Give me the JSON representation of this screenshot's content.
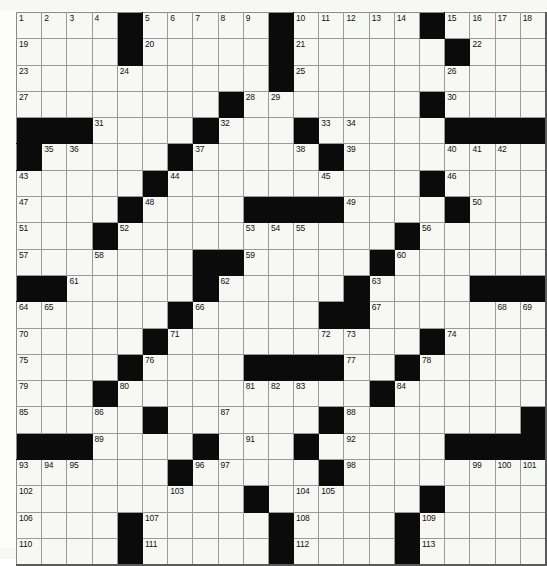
{
  "puzzle": {
    "kind": "crossword-grid",
    "rows": 21,
    "cols": 21,
    "colors": {
      "block": "#0b0b0b",
      "cell": "#f7f7f4",
      "gridline": "#9a9a9a",
      "number": "#111111",
      "page": "#ffffff"
    },
    "blocks": [
      [
        4,
        10,
        16
      ],
      [
        4,
        10,
        17
      ],
      [
        10
      ],
      [
        8,
        16
      ],
      [
        0,
        1,
        2,
        7,
        11,
        17,
        18,
        19,
        20
      ],
      [
        0,
        6,
        12
      ],
      [
        5,
        16
      ],
      [
        4,
        9,
        10,
        11,
        12,
        17
      ],
      [
        3,
        15
      ],
      [
        7,
        8,
        14
      ],
      [
        0,
        1,
        7,
        13,
        18,
        19,
        20
      ],
      [
        6,
        12,
        13
      ],
      [
        5,
        16
      ],
      [
        4,
        9,
        10,
        11,
        12,
        15
      ],
      [
        3,
        14
      ],
      [
        5,
        12,
        20
      ],
      [
        0,
        1,
        2,
        7,
        11,
        17,
        18,
        19,
        20
      ],
      [
        6,
        12
      ],
      [
        9,
        16
      ],
      [
        4,
        10,
        15
      ],
      [
        4,
        10,
        15
      ]
    ],
    "numbers": [
      {
        "r": 0,
        "c": 0,
        "n": "1"
      },
      {
        "r": 0,
        "c": 1,
        "n": "2"
      },
      {
        "r": 0,
        "c": 2,
        "n": "3"
      },
      {
        "r": 0,
        "c": 3,
        "n": "4"
      },
      {
        "r": 0,
        "c": 5,
        "n": "5"
      },
      {
        "r": 0,
        "c": 6,
        "n": "6"
      },
      {
        "r": 0,
        "c": 7,
        "n": "7"
      },
      {
        "r": 0,
        "c": 8,
        "n": "8"
      },
      {
        "r": 0,
        "c": 9,
        "n": "9"
      },
      {
        "r": 0,
        "c": 11,
        "n": "10"
      },
      {
        "r": 0,
        "c": 12,
        "n": "11"
      },
      {
        "r": 0,
        "c": 13,
        "n": "12"
      },
      {
        "r": 0,
        "c": 14,
        "n": "13"
      },
      {
        "r": 0,
        "c": 15,
        "n": "14"
      },
      {
        "r": 0,
        "c": 17,
        "n": "15"
      },
      {
        "r": 0,
        "c": 18,
        "n": "16"
      },
      {
        "r": 0,
        "c": 19,
        "n": "17"
      },
      {
        "r": 0,
        "c": 20,
        "n": "18"
      },
      {
        "r": 1,
        "c": 0,
        "n": "19"
      },
      {
        "r": 1,
        "c": 5,
        "n": "20"
      },
      {
        "r": 1,
        "c": 11,
        "n": "21"
      },
      {
        "r": 1,
        "c": 18,
        "n": "22"
      },
      {
        "r": 2,
        "c": 0,
        "n": "23"
      },
      {
        "r": 2,
        "c": 4,
        "n": "24"
      },
      {
        "r": 2,
        "c": 11,
        "n": "25"
      },
      {
        "r": 2,
        "c": 17,
        "n": "26"
      },
      {
        "r": 3,
        "c": 0,
        "n": "27"
      },
      {
        "r": 3,
        "c": 9,
        "n": "28"
      },
      {
        "r": 3,
        "c": 10,
        "n": "29"
      },
      {
        "r": 3,
        "c": 17,
        "n": "30"
      },
      {
        "r": 4,
        "c": 3,
        "n": "31"
      },
      {
        "r": 4,
        "c": 8,
        "n": "32"
      },
      {
        "r": 4,
        "c": 12,
        "n": "33"
      },
      {
        "r": 4,
        "c": 13,
        "n": "34"
      },
      {
        "r": 5,
        "c": 1,
        "n": "35"
      },
      {
        "r": 5,
        "c": 2,
        "n": "36"
      },
      {
        "r": 5,
        "c": 7,
        "n": "37"
      },
      {
        "r": 5,
        "c": 11,
        "n": "38"
      },
      {
        "r": 5,
        "c": 13,
        "n": "39"
      },
      {
        "r": 5,
        "c": 17,
        "n": "40"
      },
      {
        "r": 5,
        "c": 18,
        "n": "41"
      },
      {
        "r": 5,
        "c": 19,
        "n": "42"
      },
      {
        "r": 6,
        "c": 0,
        "n": "43"
      },
      {
        "r": 6,
        "c": 6,
        "n": "44"
      },
      {
        "r": 6,
        "c": 12,
        "n": "45"
      },
      {
        "r": 6,
        "c": 17,
        "n": "46"
      },
      {
        "r": 7,
        "c": 0,
        "n": "47"
      },
      {
        "r": 7,
        "c": 5,
        "n": "48"
      },
      {
        "r": 7,
        "c": 13,
        "n": "49"
      },
      {
        "r": 7,
        "c": 18,
        "n": "50"
      },
      {
        "r": 8,
        "c": 0,
        "n": "51"
      },
      {
        "r": 8,
        "c": 4,
        "n": "52"
      },
      {
        "r": 8,
        "c": 9,
        "n": "53"
      },
      {
        "r": 8,
        "c": 10,
        "n": "54"
      },
      {
        "r": 8,
        "c": 11,
        "n": "55"
      },
      {
        "r": 8,
        "c": 16,
        "n": "56"
      },
      {
        "r": 9,
        "c": 0,
        "n": "57"
      },
      {
        "r": 9,
        "c": 3,
        "n": "58"
      },
      {
        "r": 9,
        "c": 9,
        "n": "59"
      },
      {
        "r": 9,
        "c": 15,
        "n": "60"
      },
      {
        "r": 10,
        "c": 2,
        "n": "61"
      },
      {
        "r": 10,
        "c": 8,
        "n": "62"
      },
      {
        "r": 10,
        "c": 14,
        "n": "63"
      },
      {
        "r": 11,
        "c": 0,
        "n": "64"
      },
      {
        "r": 11,
        "c": 1,
        "n": "65"
      },
      {
        "r": 11,
        "c": 7,
        "n": "66"
      },
      {
        "r": 11,
        "c": 14,
        "n": "67"
      },
      {
        "r": 11,
        "c": 19,
        "n": "68"
      },
      {
        "r": 11,
        "c": 20,
        "n": "69"
      },
      {
        "r": 12,
        "c": 0,
        "n": "70"
      },
      {
        "r": 12,
        "c": 6,
        "n": "71"
      },
      {
        "r": 12,
        "c": 12,
        "n": "72"
      },
      {
        "r": 12,
        "c": 13,
        "n": "73"
      },
      {
        "r": 12,
        "c": 17,
        "n": "74"
      },
      {
        "r": 13,
        "c": 0,
        "n": "75"
      },
      {
        "r": 13,
        "c": 5,
        "n": "76"
      },
      {
        "r": 13,
        "c": 13,
        "n": "77"
      },
      {
        "r": 13,
        "c": 16,
        "n": "78"
      },
      {
        "r": 14,
        "c": 0,
        "n": "79"
      },
      {
        "r": 14,
        "c": 4,
        "n": "80"
      },
      {
        "r": 14,
        "c": 9,
        "n": "81"
      },
      {
        "r": 14,
        "c": 10,
        "n": "82"
      },
      {
        "r": 14,
        "c": 11,
        "n": "83"
      },
      {
        "r": 14,
        "c": 15,
        "n": "84"
      },
      {
        "r": 15,
        "c": 0,
        "n": "85"
      },
      {
        "r": 15,
        "c": 3,
        "n": "86"
      },
      {
        "r": 15,
        "c": 8,
        "n": "87"
      },
      {
        "r": 15,
        "c": 13,
        "n": "88"
      },
      {
        "r": 16,
        "c": 3,
        "n": "89"
      },
      {
        "r": 16,
        "c": 7,
        "n": "90"
      },
      {
        "r": 16,
        "c": 9,
        "n": "91"
      },
      {
        "r": 16,
        "c": 13,
        "n": "92"
      },
      {
        "r": 17,
        "c": 0,
        "n": "93"
      },
      {
        "r": 17,
        "c": 1,
        "n": "94"
      },
      {
        "r": 17,
        "c": 2,
        "n": "95"
      },
      {
        "r": 17,
        "c": 7,
        "n": "96"
      },
      {
        "r": 17,
        "c": 8,
        "n": "97"
      },
      {
        "r": 17,
        "c": 13,
        "n": "98"
      },
      {
        "r": 17,
        "c": 18,
        "n": "99"
      },
      {
        "r": 17,
        "c": 19,
        "n": "100"
      },
      {
        "r": 17,
        "c": 20,
        "n": "101"
      },
      {
        "r": 18,
        "c": 0,
        "n": "102"
      },
      {
        "r": 18,
        "c": 6,
        "n": "103"
      },
      {
        "r": 18,
        "c": 11,
        "n": "104"
      },
      {
        "r": 18,
        "c": 12,
        "n": "105"
      },
      {
        "r": 19,
        "c": 0,
        "n": "106"
      },
      {
        "r": 19,
        "c": 5,
        "n": "107"
      },
      {
        "r": 19,
        "c": 11,
        "n": "108"
      },
      {
        "r": 19,
        "c": 16,
        "n": "109"
      },
      {
        "r": 20,
        "c": 0,
        "n": "110"
      },
      {
        "r": 20,
        "c": 5,
        "n": "111"
      },
      {
        "r": 20,
        "c": 11,
        "n": "112"
      },
      {
        "r": 20,
        "c": 16,
        "n": "113"
      }
    ]
  }
}
